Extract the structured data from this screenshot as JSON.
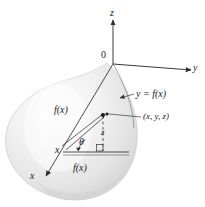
{
  "figure": {
    "axes": {
      "z_label": "z",
      "y_label": "y",
      "x_label": "x",
      "origin_label": "0"
    },
    "annotations": {
      "curve_equation": "y = f(x)",
      "point_coords": "(x, y, z)",
      "radius_slant": "f(x)",
      "radius_base": "f(x)",
      "angle": "θ",
      "height": "z",
      "x_vertex": "x"
    },
    "colors": {
      "surface_light": "#fbfbfb",
      "surface_mid": "#e8e8e8",
      "surface_shadow": "#d2d2d2",
      "outline": "#b8b8b8",
      "line": "#3a3a3a",
      "text": "#1a1a1a",
      "background": "#ffffff"
    }
  }
}
